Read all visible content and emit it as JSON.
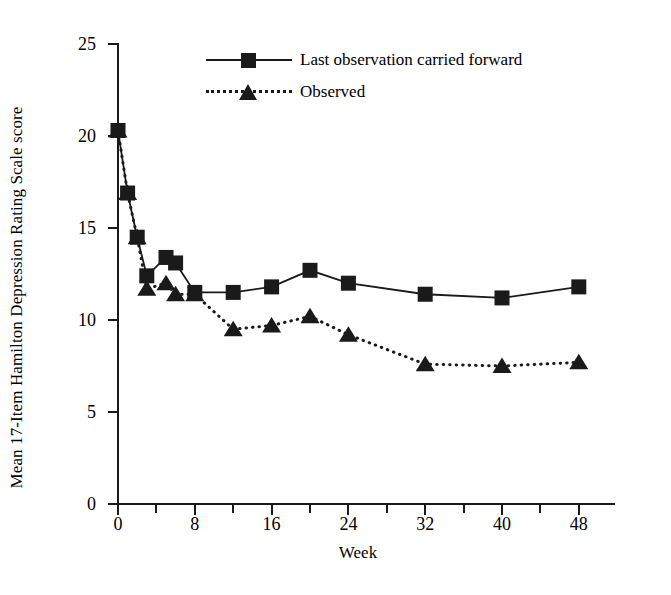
{
  "chart_data": {
    "type": "line",
    "title": "",
    "xlabel": "Week",
    "ylabel": "Mean 17-Item Hamilton Depression Rating Scale score",
    "xlim": [
      0,
      50
    ],
    "ylim": [
      0,
      25
    ],
    "xticks": [
      0,
      8,
      16,
      24,
      32,
      40,
      48
    ],
    "xticks_minor": [
      4,
      12,
      20,
      28,
      36,
      44
    ],
    "yticks": [
      0,
      5,
      10,
      15,
      20,
      25
    ],
    "grid": false,
    "legend_position": "upper center",
    "series": [
      {
        "name": "Last observation carried forward",
        "marker": "square",
        "linestyle": "solid",
        "color": "#1a1a1a",
        "x": [
          0,
          1,
          2,
          3,
          5,
          6,
          8,
          12,
          16,
          20,
          24,
          32,
          40,
          48
        ],
        "values": [
          20.3,
          16.9,
          14.5,
          12.4,
          13.4,
          13.1,
          11.5,
          11.5,
          11.8,
          12.7,
          12.0,
          11.4,
          11.2,
          11.8
        ]
      },
      {
        "name": "Observed",
        "marker": "triangle",
        "linestyle": "dotted",
        "color": "#1a1a1a",
        "x": [
          0,
          1,
          2,
          3,
          5,
          6,
          8,
          12,
          16,
          20,
          24,
          32,
          40,
          48
        ],
        "values": [
          20.3,
          16.9,
          14.5,
          11.7,
          12.0,
          11.4,
          11.4,
          9.5,
          9.7,
          10.2,
          9.2,
          7.6,
          7.5,
          7.7
        ]
      }
    ]
  },
  "axes": {
    "x_title": "Week",
    "y_title": "Mean 17-Item Hamilton Depression Rating Scale score",
    "x_tick_labels": [
      "0",
      "8",
      "16",
      "24",
      "32",
      "40",
      "48"
    ],
    "y_tick_labels": [
      "0",
      "5",
      "10",
      "15",
      "20",
      "25"
    ]
  },
  "legend": {
    "items": [
      {
        "label": "Last observation carried forward",
        "marker": "square-marker",
        "line": "solid-line"
      },
      {
        "label": "Observed",
        "marker": "triangle-marker",
        "line": "dotted-line"
      }
    ]
  },
  "style": {
    "ink": "#1a1a1a",
    "background": "#ffffff"
  }
}
